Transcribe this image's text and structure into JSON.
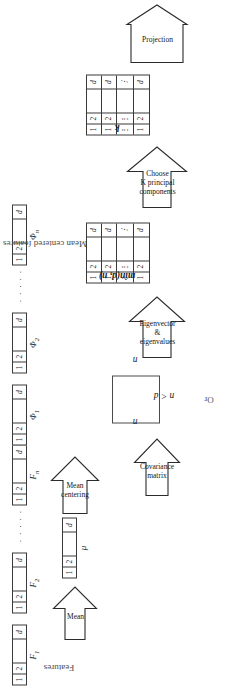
{
  "figure": {
    "orientation_deg": -90
  },
  "captions": {
    "features": "Features",
    "mean_centered": "Mean centered features"
  },
  "cells": {
    "one": "1",
    "two": "2",
    "blank": "",
    "d": "d",
    "hdots": "…",
    "vdots": "⋮"
  },
  "ellipsis": "· · · · ·",
  "stages": {
    "features_row": {
      "name": "Features",
      "vectors": [
        {
          "label": "F",
          "sub": "1",
          "cells": [
            "1",
            "2",
            "",
            "d"
          ]
        },
        {
          "label": "F",
          "sub": "2",
          "cells": [
            "1",
            "2",
            "",
            "d"
          ]
        },
        {
          "label": "F",
          "sub": "n",
          "cells": [
            "1",
            "2",
            "",
            "d"
          ]
        }
      ]
    },
    "mean_arrow": {
      "label": "Mean"
    },
    "mu_vector": {
      "label": "μ",
      "cells": [
        "1",
        "2",
        "",
        "d"
      ]
    },
    "mean_centering_arrow": {
      "label": "Mean\ncentering"
    },
    "phi_row": {
      "name": "Mean centered features",
      "vectors": [
        {
          "label": "Φ",
          "sub": "1",
          "cells": [
            "1",
            "2",
            "",
            "d"
          ]
        },
        {
          "label": "Φ",
          "sub": "2",
          "cells": [
            "1",
            "2",
            "",
            "d"
          ]
        },
        {
          "label": "Φ",
          "sub": "n",
          "cells": [
            "1",
            "2",
            "",
            "d"
          ]
        }
      ]
    },
    "covariance_arrow": {
      "label": "Covariance\nmatrix"
    },
    "covariance_options": {
      "or_label": "Or",
      "option_a": {
        "side_label": "d",
        "bottom_label": "d",
        "condition": "d ≤ n"
      },
      "option_b": {
        "side_label": "n",
        "bottom_label": "n",
        "condition": "n < d"
      }
    },
    "eigen_arrow": {
      "label": "Eigenvector\n&\neigenvalues"
    },
    "eigen_matrix": {
      "label": "min(d, n)",
      "rows": [
        [
          "1",
          "2",
          "",
          "d"
        ],
        [
          "1",
          "2",
          "",
          "d"
        ],
        [
          "⋮",
          "⋮",
          "",
          "⋮"
        ],
        [
          "1",
          "2",
          "",
          "d"
        ]
      ]
    },
    "choose_arrow": {
      "label": "Choose\nK principal\ncomponents"
    },
    "k_matrix": {
      "label": "k",
      "rows": [
        [
          "1",
          "2",
          "",
          "d"
        ],
        [
          "1",
          "2",
          "",
          "d"
        ],
        [
          "⋮",
          "⋮",
          "",
          "⋮"
        ],
        [
          "1",
          "2",
          "",
          "d"
        ]
      ]
    },
    "projection_arrow": {
      "label": "Projection"
    }
  },
  "colors": {
    "stroke": "#3a3a3a",
    "text": "#1c1c1c",
    "caption": "#4a4a4a",
    "background": "#ffffff"
  }
}
